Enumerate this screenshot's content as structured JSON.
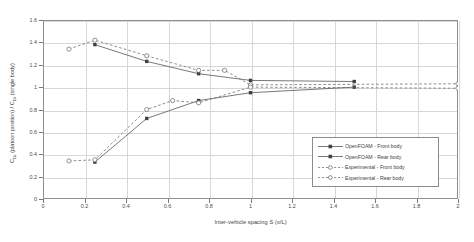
{
  "chart_data": {
    "type": "line",
    "title": "",
    "xlabel": "Inter-vehicle spacing S (x/L)",
    "ylabel": "C_Dr (platoon position) / C_Dr (single body)",
    "xlim": [
      0,
      2
    ],
    "ylim": [
      0,
      1.6
    ],
    "xticks": [
      "0",
      "0.2",
      "0.4",
      "0.6",
      "0.8",
      "1",
      "1.2",
      "1.4",
      "1.6",
      "1.8",
      "2"
    ],
    "xtick_values": [
      0,
      0.2,
      0.4,
      0.6,
      0.8,
      1.0,
      1.2,
      1.4,
      1.6,
      1.8,
      2.0
    ],
    "yticks": [
      "0",
      "0.2",
      "0.4",
      "0.6",
      "0.8",
      "1",
      "1.2",
      "1.4",
      "1.6"
    ],
    "ytick_values": [
      0,
      0.2,
      0.4,
      0.6,
      0.8,
      1.0,
      1.2,
      1.4,
      1.6
    ],
    "grid": true,
    "legend_position": "lower-right",
    "series": [
      {
        "name": "OpenFOAM - Front body",
        "style": "solid",
        "marker": "filled-square",
        "color": "#555555",
        "x": [
          0.25,
          0.5,
          0.75,
          1.0,
          1.5
        ],
        "y": [
          1.38,
          1.23,
          1.12,
          1.06,
          1.05
        ]
      },
      {
        "name": "OpenFOAM - Rear body",
        "style": "solid",
        "marker": "filled-square",
        "color": "#555555",
        "x": [
          0.25,
          0.5,
          0.75,
          1.0,
          1.5
        ],
        "y": [
          0.33,
          0.72,
          0.88,
          0.95,
          1.0
        ]
      },
      {
        "name": "Experimental - Front body",
        "style": "dashed",
        "marker": "open-circle",
        "color": "#6e6e6e",
        "x": [
          0.125,
          0.25,
          0.5,
          0.75,
          0.875,
          1.0,
          2.0
        ],
        "y": [
          1.34,
          1.42,
          1.28,
          1.15,
          1.15,
          1.02,
          1.03
        ]
      },
      {
        "name": "Experimental - Rear body",
        "style": "dashed",
        "marker": "open-circle",
        "color": "#6e6e6e",
        "x": [
          0.125,
          0.25,
          0.5,
          0.625,
          0.75,
          1.0,
          2.0
        ],
        "y": [
          0.34,
          0.35,
          0.8,
          0.88,
          0.86,
          1.0,
          0.99
        ]
      }
    ]
  },
  "legend": {
    "items": [
      {
        "label": "OpenFOAM - Front body"
      },
      {
        "label": "OpenFOAM - Rear body"
      },
      {
        "label": "Experimental - Front body"
      },
      {
        "label": "Experimental - Rear body"
      }
    ]
  }
}
